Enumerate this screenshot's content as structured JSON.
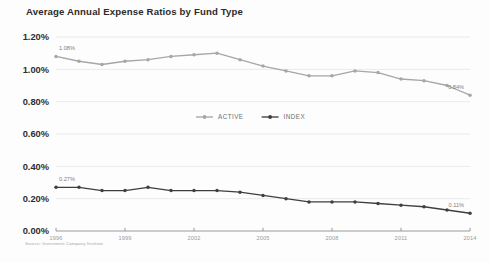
{
  "chart_data": {
    "type": "line",
    "title": "Average Annual Expense Ratios by Fund Type",
    "xlabel": "",
    "ylabel": "",
    "ylim": [
      0.0,
      1.2
    ],
    "xlim": [
      1996,
      2014
    ],
    "grid": true,
    "legend_position": "center",
    "source": "Source: Investment Company Institute",
    "x": [
      1996,
      1997,
      1998,
      1999,
      2000,
      2001,
      2002,
      2003,
      2004,
      2005,
      2006,
      2007,
      2008,
      2009,
      2010,
      2011,
      2012,
      2013,
      2014
    ],
    "y_tick_labels": [
      "0.00%",
      "0.20%",
      "0.40%",
      "0.60%",
      "0.80%",
      "1.00%",
      "1.20%"
    ],
    "y_tick_values": [
      0.0,
      0.2,
      0.4,
      0.6,
      0.8,
      1.0,
      1.2
    ],
    "x_tick_labels": [
      "1996",
      "1999",
      "2002",
      "2005",
      "2008",
      "2011",
      "2014"
    ],
    "x_tick_values": [
      1996,
      1999,
      2002,
      2005,
      2008,
      2011,
      2014
    ],
    "series": [
      {
        "name": "ACTIVE",
        "color": "#a6a6a6",
        "values": [
          1.08,
          1.05,
          1.03,
          1.05,
          1.06,
          1.08,
          1.09,
          1.1,
          1.06,
          1.02,
          0.99,
          0.96,
          0.96,
          0.99,
          0.98,
          0.94,
          0.93,
          0.9,
          0.84
        ],
        "start_label": "1.08%",
        "end_label": "0.84%"
      },
      {
        "name": "INDEX",
        "color": "#3f3f3f",
        "values": [
          0.27,
          0.27,
          0.25,
          0.25,
          0.27,
          0.25,
          0.25,
          0.25,
          0.24,
          0.22,
          0.2,
          0.18,
          0.18,
          0.18,
          0.17,
          0.16,
          0.15,
          0.13,
          0.11
        ],
        "start_label": "0.27%",
        "end_label": "0.11%"
      }
    ],
    "legend": [
      {
        "label": "ACTIVE",
        "color": "#a6a6a6"
      },
      {
        "label": "INDEX",
        "color": "#3f3f3f"
      }
    ]
  }
}
